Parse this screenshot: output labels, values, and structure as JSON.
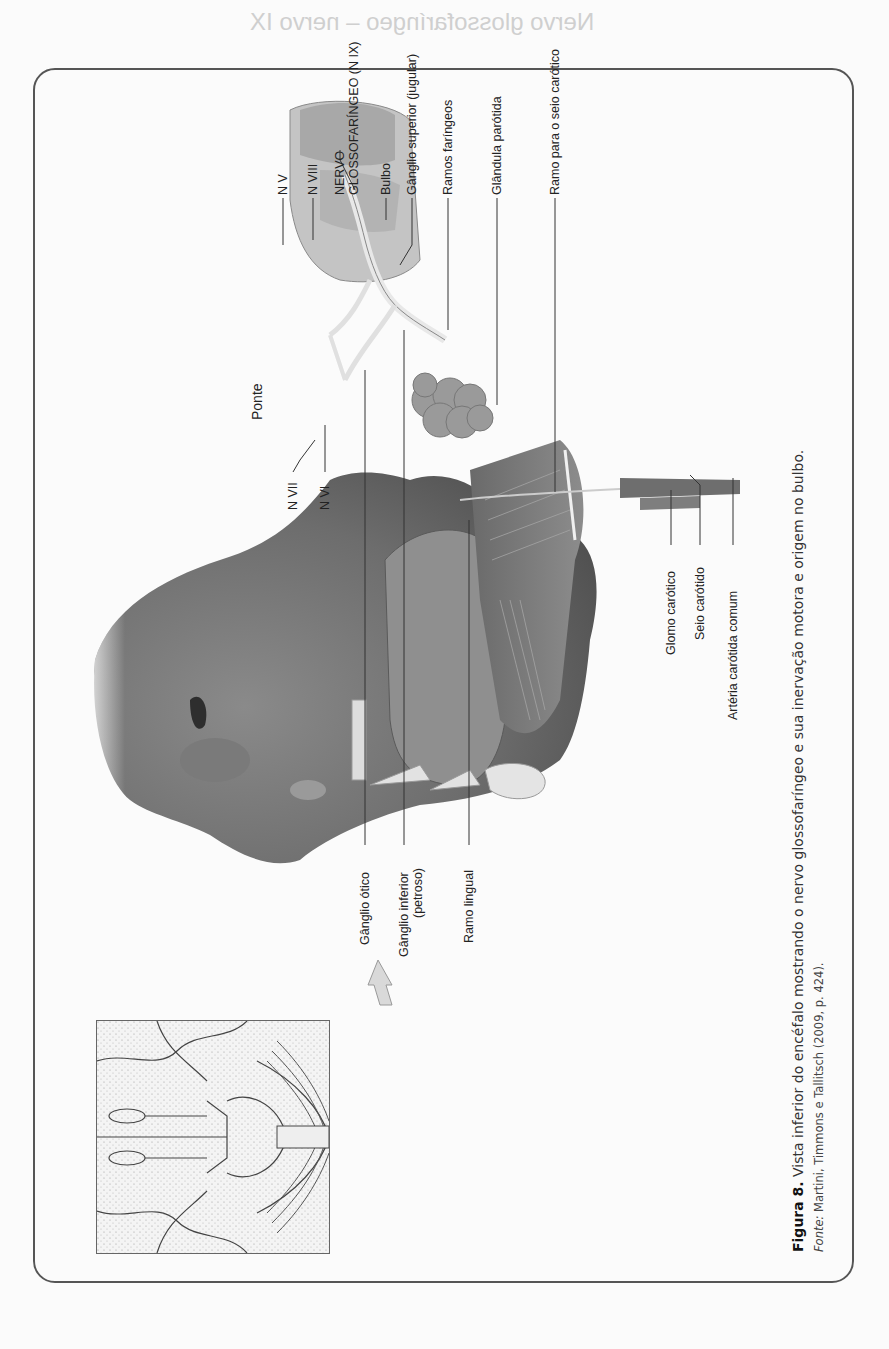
{
  "page": {
    "bleed_through_heading": "Nervo glossofaríngeo – nervo IX"
  },
  "figure": {
    "labels_top": [
      {
        "id": "nv",
        "text": "N V"
      },
      {
        "id": "nviii",
        "text": "N VIII"
      },
      {
        "id": "nervo_line1",
        "text": "NERVO"
      },
      {
        "id": "nervo_line2",
        "text": "GLOSSOFARÍNGEO (N IX)"
      },
      {
        "id": "bulbo",
        "text": "Bulbo"
      },
      {
        "id": "ganglio_superior",
        "text": "Gânglio superior (jugular)"
      },
      {
        "id": "ramos_faringeos",
        "text": "Ramos faríngeos"
      },
      {
        "id": "glandula_parotida",
        "text": "Glândula parótida"
      },
      {
        "id": "ramo_seio",
        "text": "Ramo para o seio carótico"
      }
    ],
    "labels_inline": [
      {
        "id": "ponte",
        "text": "Ponte"
      },
      {
        "id": "nvii",
        "text": "N VII"
      },
      {
        "id": "nvi",
        "text": "N VI"
      }
    ],
    "labels_right": [
      {
        "id": "glomo",
        "text": "Glomo carótico"
      },
      {
        "id": "seio",
        "text": "Seio carótido"
      },
      {
        "id": "arteria",
        "text": "Artéria carótida comum"
      }
    ],
    "labels_bottom": [
      {
        "id": "ganglio_otico",
        "text": "Gânglio ótico"
      },
      {
        "id": "ganglio_inferior_1",
        "text": "Gânglio inferior"
      },
      {
        "id": "ganglio_inferior_2",
        "text": "(petroso)"
      },
      {
        "id": "ramo_lingual",
        "text": "Ramo lingual"
      }
    ],
    "caption": {
      "number": "Figura 8.",
      "text": "Vista inferior do encéfalo mostrando o nervo glossofaríngeo e sua inervação motora e origem no bulbo.",
      "source_label": "Fonte:",
      "source_text": "Martini, Timmons e Tallitsch (2009, p. 424)."
    }
  }
}
